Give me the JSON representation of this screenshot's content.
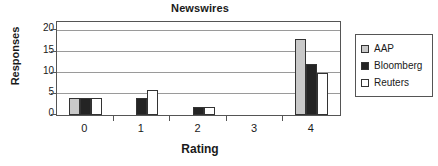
{
  "chart_data": {
    "type": "bar",
    "title": "Newswires",
    "xlabel": "Rating",
    "ylabel": "Responses",
    "categories": [
      "0",
      "1",
      "2",
      "3",
      "4"
    ],
    "series": [
      {
        "name": "AAP",
        "color": "#c9c9c9",
        "values": [
          4,
          0,
          0,
          0,
          18
        ]
      },
      {
        "name": "Bloomberg",
        "color": "#242424",
        "values": [
          4,
          4,
          2,
          0,
          12
        ]
      },
      {
        "name": "Reuters",
        "color": "#ffffff",
        "values": [
          4,
          6,
          2,
          0,
          10
        ]
      }
    ],
    "ylim": [
      0,
      22
    ],
    "yticks": [
      0,
      5,
      10,
      15,
      20
    ],
    "ytick_labels": [
      "0",
      "5",
      "10",
      "15",
      "20"
    ],
    "grid": true,
    "legend_position": "right",
    "orientation": "vertical"
  },
  "legend": {
    "items": [
      {
        "label": "AAP"
      },
      {
        "label": "Bloomberg"
      },
      {
        "label": "Reuters"
      }
    ]
  }
}
